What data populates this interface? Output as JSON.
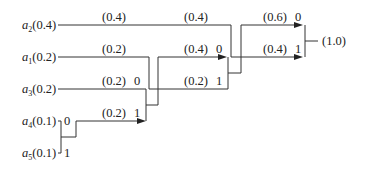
{
  "diagram": {
    "type": "huffman-code-tree",
    "symbols": [
      {
        "id": "a2",
        "name": "a",
        "sub": "2",
        "prob": "(0.4)"
      },
      {
        "id": "a1",
        "name": "a",
        "sub": "1",
        "prob": "(0.2)"
      },
      {
        "id": "a3",
        "name": "a",
        "sub": "3",
        "prob": "(0.2)"
      },
      {
        "id": "a4",
        "name": "a",
        "sub": "4",
        "prob": "(0.1)"
      },
      {
        "id": "a5",
        "name": "a",
        "sub": "5",
        "prob": "(0.1)"
      }
    ],
    "edges": {
      "a2_prob": "(0.4)",
      "a2_stage2_prob": "(0.4)",
      "a1_prob": "(0.2)",
      "a3_prob": "(0.2)",
      "a3_bit": "0",
      "a4_bit": "0",
      "a5_bit": "1",
      "m45_prob": "(0.2)",
      "m45_bit": "1",
      "m345_prob": "(0.4)",
      "m345_bit": "0",
      "a1_stage3_prob": "(0.2)",
      "a1_stage3_bit": "1",
      "m1345_prob": "(0.6)",
      "m1345_bit": "0",
      "a2_final_prob": "(0.4)",
      "a2_final_bit": "1",
      "root_prob": "(1.0)"
    }
  }
}
